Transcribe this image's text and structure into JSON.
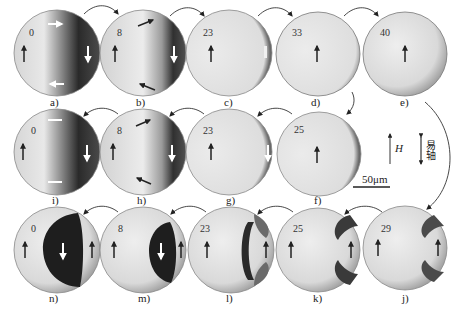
{
  "figure": {
    "panels": [
      {
        "id": "a",
        "label": "a)",
        "value": "0",
        "state": "vortex-dark-right"
      },
      {
        "id": "b",
        "label": "b)",
        "value": "8",
        "state": "vortex-shifted"
      },
      {
        "id": "c",
        "label": "c)",
        "value": "23",
        "state": "edge-wall"
      },
      {
        "id": "d",
        "label": "d)",
        "value": "33",
        "state": "saturated"
      },
      {
        "id": "e",
        "label": "e)",
        "value": "40",
        "state": "saturated"
      },
      {
        "id": "f",
        "label": "f)",
        "value": "25",
        "state": "edge-shadow"
      },
      {
        "id": "g",
        "label": "g)",
        "value": "23",
        "state": "edge-wall"
      },
      {
        "id": "h",
        "label": "h)",
        "value": "8",
        "state": "vortex-shifted"
      },
      {
        "id": "i",
        "label": "i)",
        "value": "0",
        "state": "vortex-dark-right"
      },
      {
        "id": "j",
        "label": "j)",
        "value": "29",
        "state": "notches"
      },
      {
        "id": "k",
        "label": "k)",
        "value": "25",
        "state": "notches"
      },
      {
        "id": "l",
        "label": "l)",
        "value": "23",
        "state": "stripe-wall"
      },
      {
        "id": "m",
        "label": "m)",
        "value": "8",
        "state": "dark-domain"
      },
      {
        "id": "n",
        "label": "n)",
        "value": "0",
        "state": "dark-domain-large"
      }
    ],
    "legend": {
      "field_label": "H",
      "easy_axis_label": "易轴",
      "scale_bar_label": "50μm"
    },
    "colors": {
      "background": "#ffffff",
      "ink": "#222222",
      "domain_light": "#e6e6e6",
      "domain_dark": "#1e1e1e"
    }
  }
}
